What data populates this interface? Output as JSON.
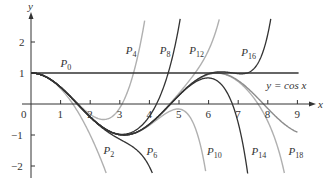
{
  "chart_data": {
    "type": "line",
    "title": "",
    "xlabel": "x",
    "ylabel": "y",
    "xlim": [
      0,
      9.5
    ],
    "ylim": [
      -2.3,
      2.7
    ],
    "grid": false,
    "x_ticks": [
      0,
      1,
      2,
      3,
      4,
      5,
      6,
      7,
      8,
      9
    ],
    "y_ticks": [
      2,
      1,
      -1,
      -2
    ],
    "function_label": "y = cos x",
    "series": [
      {
        "name": "P0",
        "degree": 0,
        "color": "#333333",
        "label_pos": [
          1.0,
          1.2
        ]
      },
      {
        "name": "P2",
        "degree": 2,
        "color": "#b0b0b0",
        "label_pos": [
          2.45,
          -1.6
        ]
      },
      {
        "name": "P4",
        "degree": 4,
        "color": "#b0b0b0",
        "label_pos": [
          3.2,
          1.6
        ]
      },
      {
        "name": "P6",
        "degree": 6,
        "color": "#333333",
        "label_pos": [
          3.9,
          -1.65
        ]
      },
      {
        "name": "P8",
        "degree": 8,
        "color": "#333333",
        "label_pos": [
          4.35,
          1.6
        ]
      },
      {
        "name": "P10",
        "degree": 10,
        "color": "#b0b0b0",
        "label_pos": [
          5.95,
          -1.65
        ]
      },
      {
        "name": "P12",
        "degree": 12,
        "color": "#b0b0b0",
        "label_pos": [
          5.35,
          1.6
        ]
      },
      {
        "name": "P14",
        "degree": 14,
        "color": "#333333",
        "label_pos": [
          7.45,
          -1.65
        ]
      },
      {
        "name": "P16",
        "degree": 16,
        "color": "#333333",
        "label_pos": [
          7.1,
          1.55
        ]
      },
      {
        "name": "P18",
        "degree": 18,
        "color": "#b0b0b0",
        "label_pos": [
          8.7,
          -1.65
        ]
      },
      {
        "name": "cos x",
        "degree": -1,
        "color": "#8c8c8c",
        "label_pos": [
          7.95,
          0.5
        ]
      }
    ],
    "colors": {
      "axis": "#333333",
      "dark": "#333333",
      "light": "#b0b0b0",
      "cos": "#8c8c8c"
    }
  },
  "axes": {
    "x_label": "x",
    "y_label": "y",
    "origin_label": "0"
  }
}
